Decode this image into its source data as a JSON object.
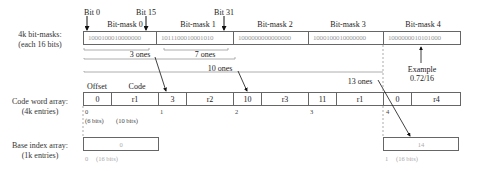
{
  "top_labels": {
    "bit0": "Bit 0",
    "bit15": "Bit 15",
    "bit31": "Bit 31"
  },
  "bitmasks": {
    "row_label_line1": "4k bit-masks:",
    "row_label_line2": "(each 16 bits)",
    "items": [
      {
        "title": "Bit-mask 0",
        "bits": "1000100010000000"
      },
      {
        "title": "Bit-mask 1",
        "bits": "1011100010001010"
      },
      {
        "title": "Bit-mask 2",
        "bits": "1000000000000000"
      },
      {
        "title": "Bit-mask 3",
        "bits": "1000100010000000"
      },
      {
        "title": "Bit-mask 4",
        "bits": "1000000010101000"
      }
    ]
  },
  "braces": {
    "three_ones": "3 ones",
    "seven_ones": "7 ones",
    "ten_ones": "10 ones",
    "thirteen_ones": "13 ones"
  },
  "example": {
    "line1": "Example",
    "line2": "0.72/16"
  },
  "codewords": {
    "row_label_line1": "Code word array:",
    "row_label_line2": "(4k entries)",
    "header_offset": "Offset",
    "header_code": "Code",
    "entries": [
      {
        "offset": "0",
        "code": "r1",
        "index": "0"
      },
      {
        "offset": "3",
        "code": "r2",
        "index": "1"
      },
      {
        "offset": "10",
        "code": "r3",
        "index": "2"
      },
      {
        "offset": "11",
        "code": "r1",
        "index": "3"
      },
      {
        "offset": "0",
        "code": "r4",
        "index": "4"
      }
    ],
    "offset_bits": "(6 bits)",
    "code_bits": "(10 bits)"
  },
  "base_index": {
    "row_label_line1": "Base index array:",
    "row_label_line2": "(1k entries)",
    "entries": [
      {
        "value": "0",
        "index": "0",
        "bits": "(16 bits)"
      },
      {
        "value": "14",
        "index": "1",
        "bits": "(16 bits)"
      }
    ]
  }
}
